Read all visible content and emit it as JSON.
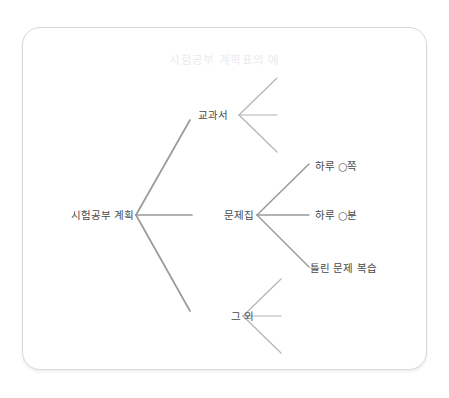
{
  "card": {
    "border_color": "#d8d8d8",
    "background": "#ffffff"
  },
  "diagram": {
    "title": "시험공부 계획표의 예",
    "title_color": "#ebebeb",
    "line_color": "#9a9a9a",
    "label_color": "#4a4a4a",
    "root": {
      "label": "시험공부 계획"
    },
    "branches": [
      {
        "label": "교과서",
        "children": [
          {
            "label": ""
          },
          {
            "label": ""
          },
          {
            "label": ""
          }
        ]
      },
      {
        "label": "문제집",
        "children": [
          {
            "label": "하루 ○쪽"
          },
          {
            "label": "하루 ○분"
          },
          {
            "label": "틀린 문제 복습"
          }
        ]
      },
      {
        "label": "그 외",
        "children": [
          {
            "label": ""
          },
          {
            "label": ""
          },
          {
            "label": ""
          }
        ]
      }
    ]
  }
}
